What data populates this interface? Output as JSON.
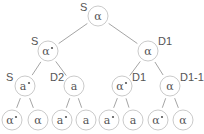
{
  "tree": {
    "nodes": [
      {
        "id": "n0",
        "x": 98,
        "y": 16,
        "r": 10,
        "symbol": "α",
        "label": "S",
        "lx": 80,
        "ly": 11
      },
      {
        "id": "n1",
        "x": 48,
        "y": 51,
        "r": 10,
        "symbol": "α*",
        "label": "S",
        "lx": 31,
        "ly": 45
      },
      {
        "id": "n2",
        "x": 148,
        "y": 51,
        "r": 10,
        "symbol": "α",
        "label": "D1",
        "lx": 158,
        "ly": 45
      },
      {
        "id": "n3",
        "x": 25,
        "y": 86,
        "r": 10,
        "symbol": "a*",
        "label": "S",
        "lx": 6,
        "ly": 81
      },
      {
        "id": "n4",
        "x": 74,
        "y": 86,
        "r": 10,
        "symbol": "a",
        "label": "D2",
        "lx": 50,
        "ly": 81
      },
      {
        "id": "n5",
        "x": 122,
        "y": 86,
        "r": 10,
        "symbol": "α*",
        "label": "D1",
        "lx": 132,
        "ly": 81
      },
      {
        "id": "n6",
        "x": 170,
        "y": 86,
        "r": 10,
        "symbol": "α",
        "label": "D1-1",
        "lx": 180,
        "ly": 81
      },
      {
        "id": "n7",
        "x": 12,
        "y": 120,
        "r": 10,
        "symbol": "α*",
        "label": ""
      },
      {
        "id": "n8",
        "x": 38,
        "y": 120,
        "r": 10,
        "symbol": "α",
        "label": ""
      },
      {
        "id": "n9",
        "x": 62,
        "y": 120,
        "r": 10,
        "symbol": "a*",
        "label": ""
      },
      {
        "id": "n10",
        "x": 86,
        "y": 120,
        "r": 10,
        "symbol": "a",
        "label": ""
      },
      {
        "id": "n11",
        "x": 109,
        "y": 120,
        "r": 10,
        "symbol": "a*",
        "label": ""
      },
      {
        "id": "n12",
        "x": 133,
        "y": 120,
        "r": 10,
        "symbol": "a",
        "label": ""
      },
      {
        "id": "n13",
        "x": 158,
        "y": 120,
        "r": 10,
        "symbol": "α*",
        "label": ""
      },
      {
        "id": "n14",
        "x": 183,
        "y": 120,
        "r": 10,
        "symbol": "α",
        "label": ""
      }
    ],
    "edges": [
      [
        "n0",
        "n1"
      ],
      [
        "n0",
        "n2"
      ],
      [
        "n1",
        "n3"
      ],
      [
        "n1",
        "n4"
      ],
      [
        "n2",
        "n5"
      ],
      [
        "n2",
        "n6"
      ],
      [
        "n3",
        "n7"
      ],
      [
        "n3",
        "n8"
      ],
      [
        "n4",
        "n9"
      ],
      [
        "n4",
        "n10"
      ],
      [
        "n5",
        "n11"
      ],
      [
        "n5",
        "n12"
      ],
      [
        "n6",
        "n13"
      ],
      [
        "n6",
        "n14"
      ]
    ]
  }
}
